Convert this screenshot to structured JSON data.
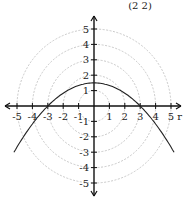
{
  "header": {
    "text": "(2  2)"
  },
  "chart_data": {
    "type": "line",
    "title": "",
    "xlabel": "r",
    "ylabel": "",
    "xlim": [
      -5.5,
      5.5
    ],
    "ylim": [
      -5.5,
      5.5
    ],
    "x_ticks": [
      "-5",
      "-4",
      "-3",
      "-2",
      "-1",
      "1",
      "2",
      "3",
      "4",
      "5"
    ],
    "y_ticks": [
      "5",
      "4",
      "3",
      "2",
      "1",
      "-1",
      "-2",
      "-3",
      "-4",
      "-5"
    ],
    "polar_grid_circles": [
      1,
      2,
      3,
      4,
      5
    ],
    "series": [
      {
        "name": "curve",
        "x": [
          -5,
          -4,
          -3,
          -2,
          -1,
          0,
          1,
          2,
          3,
          4,
          5
        ],
        "y": [
          -2.67,
          -1.17,
          0,
          0.83,
          1.33,
          1.5,
          1.33,
          0.83,
          0,
          -1.17,
          -2.67
        ]
      }
    ],
    "grid": true
  },
  "colors": {
    "axis": "#111111",
    "grid": "#bbbbbb",
    "curve": "#222222"
  }
}
